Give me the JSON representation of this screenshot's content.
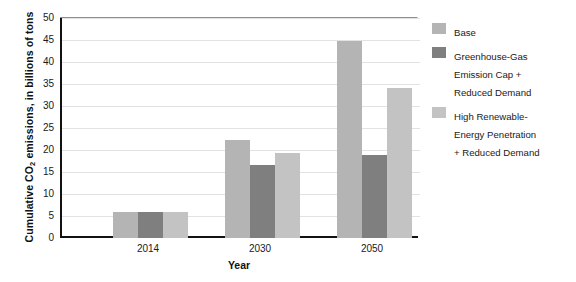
{
  "chart_data": {
    "type": "bar",
    "title": "",
    "subtitle": "",
    "xlabel": "Year",
    "ylabel": "Cumulative CO2 emissions, in billions of tons",
    "ylabel_parts": {
      "pre": "Cumulative CO",
      "sub": "2",
      "post": " emissions, in billions of tons"
    },
    "categories": [
      "2014",
      "2030",
      "2050"
    ],
    "series": [
      {
        "name": "Base",
        "color": "#b4b4b4",
        "values": [
          6.0,
          22.3,
          44.8
        ]
      },
      {
        "name": "Greenhouse-Gas\nEmission Cap +\nReduced Demand",
        "color": "#7f7f7f",
        "values": [
          6.0,
          16.6,
          18.8
        ]
      },
      {
        "name": "High Renewable-\nEnergy Penetration\n + Reduced Demand",
        "color": "#c3c3c3",
        "values": [
          6.0,
          19.3,
          34.0
        ]
      }
    ],
    "ylim": [
      0,
      50
    ],
    "ytick_step": 5,
    "yticks": [
      "50",
      "45",
      "40",
      "35",
      "30",
      "25",
      "20",
      "15",
      "10",
      "5",
      "0"
    ],
    "grid": true,
    "legend_position": "right",
    "axis_color": "#111111",
    "grid_color": "#e2e2e2",
    "background": "#ffffff"
  },
  "legend": {
    "entries": [
      {
        "label": "Base",
        "color": "#b4b4b4"
      },
      {
        "label": "Greenhouse-Gas\nEmission Cap +\nReduced Demand",
        "color": "#7f7f7f"
      },
      {
        "label": "High Renewable-\nEnergy Penetration\n + Reduced Demand",
        "color": "#c3c3c3"
      }
    ]
  }
}
